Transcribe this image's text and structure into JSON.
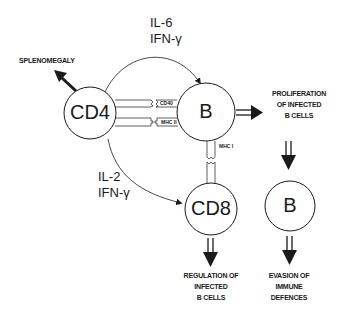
{
  "diagram": {
    "cells": {
      "cd4": "CD4",
      "b_main": "B",
      "cd8": "CD8",
      "b_evading": "B"
    },
    "cytokines": {
      "cd4_to_b": [
        "IL-6",
        "IFN-γ"
      ],
      "cd4_to_cd8": [
        "IL-2",
        "IFN-γ"
      ]
    },
    "receptors": {
      "cd40": "CD40",
      "mhc2": "MHC II",
      "mhc1": "MHC I"
    },
    "outcomes": {
      "splenomegaly": "SPLENOMEGALY",
      "proliferation": [
        "PROLIFERATION",
        "OF INFECTED",
        "B CELLS"
      ],
      "regulation": [
        "REGULATION OF",
        "INFECTED",
        "B CELLS"
      ],
      "evasion": [
        "EVASION OF",
        "IMMUNE",
        "DEFENCES"
      ]
    },
    "colors": {
      "stroke": "#1a1a1a",
      "background": "#ffffff"
    }
  }
}
